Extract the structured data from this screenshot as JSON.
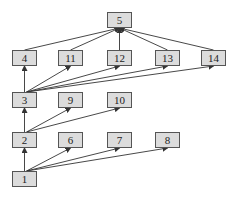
{
  "nodes": [
    {
      "id": "5",
      "label": "5",
      "x": 107,
      "y": 12
    },
    {
      "id": "4",
      "label": "4",
      "x": 12,
      "y": 50
    },
    {
      "id": "11",
      "label": "11",
      "x": 58,
      "y": 50
    },
    {
      "id": "12",
      "label": "12",
      "x": 107,
      "y": 50
    },
    {
      "id": "13",
      "label": "13",
      "x": 155,
      "y": 50
    },
    {
      "id": "14",
      "label": "14",
      "x": 201,
      "y": 50
    },
    {
      "id": "3",
      "label": "3",
      "x": 12,
      "y": 92
    },
    {
      "id": "9",
      "label": "9",
      "x": 58,
      "y": 92
    },
    {
      "id": "10",
      "label": "10",
      "x": 107,
      "y": 92
    },
    {
      "id": "2",
      "label": "2",
      "x": 12,
      "y": 132
    },
    {
      "id": "6",
      "label": "6",
      "x": 58,
      "y": 132
    },
    {
      "id": "7",
      "label": "7",
      "x": 107,
      "y": 132
    },
    {
      "id": "8",
      "label": "8",
      "x": 155,
      "y": 132
    },
    {
      "id": "1",
      "label": "1",
      "x": 12,
      "y": 171
    }
  ],
  "edges": [
    {
      "from": "1",
      "to": "2"
    },
    {
      "from": "1",
      "to": "6"
    },
    {
      "from": "1",
      "to": "7"
    },
    {
      "from": "1",
      "to": "8"
    },
    {
      "from": "2",
      "to": "3"
    },
    {
      "from": "2",
      "to": "9"
    },
    {
      "from": "2",
      "to": "10"
    },
    {
      "from": "3",
      "to": "4"
    },
    {
      "from": "3",
      "to": "11"
    },
    {
      "from": "3",
      "to": "12"
    },
    {
      "from": "3",
      "to": "13"
    },
    {
      "from": "3",
      "to": "14"
    },
    {
      "from": "4",
      "to": "5"
    },
    {
      "from": "11",
      "to": "5"
    },
    {
      "from": "12",
      "to": "5"
    },
    {
      "from": "13",
      "to": "5"
    },
    {
      "from": "14",
      "to": "5"
    }
  ],
  "colors": {
    "node_fill": "#dcdcdc",
    "node_border": "#555555",
    "edge": "#333333"
  }
}
